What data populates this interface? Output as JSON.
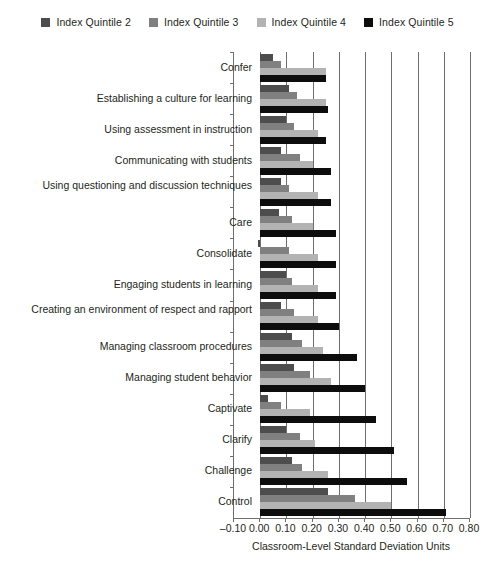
{
  "chart_data": {
    "type": "bar",
    "orientation": "horizontal",
    "title": "",
    "xlabel": "Classroom-Level Standard Deviation Units",
    "ylabel": "",
    "xlim": [
      -0.1,
      0.8
    ],
    "xticks": [
      "-0.10",
      "0.00",
      "0.10",
      "0.20",
      "0.30",
      "0.40",
      "0.50",
      "0.60",
      "0.70",
      "0.80"
    ],
    "xtick_values": [
      -0.1,
      0.0,
      0.1,
      0.2,
      0.3,
      0.4,
      0.5,
      0.6,
      0.7,
      0.8
    ],
    "grid": true,
    "legend_position": "top",
    "categories": [
      "Confer",
      "Establishing a culture for learning",
      "Using assessment in instruction",
      "Communicating with students",
      "Using questioning and discussion techniques",
      "Care",
      "Consolidate",
      "Engaging students in learning",
      "Creating an environment of respect and rapport",
      "Managing classroom procedures",
      "Managing student behavior",
      "Captivate",
      "Clarify",
      "Challenge",
      "Control"
    ],
    "series": [
      {
        "name": "Index Quintile 2",
        "color": "#4d4d4d",
        "values": [
          0.05,
          0.11,
          0.1,
          0.08,
          0.08,
          0.07,
          -0.01,
          0.1,
          0.08,
          0.12,
          0.13,
          0.03,
          0.1,
          0.12,
          0.26
        ]
      },
      {
        "name": "Index Quintile 3",
        "color": "#808080",
        "values": [
          0.08,
          0.14,
          0.13,
          0.15,
          0.11,
          0.12,
          0.11,
          0.12,
          0.13,
          0.16,
          0.19,
          0.08,
          0.15,
          0.16,
          0.36
        ]
      },
      {
        "name": "Index Quintile 4",
        "color": "#b3b3b3",
        "values": [
          0.25,
          0.25,
          0.22,
          0.2,
          0.22,
          0.2,
          0.22,
          0.22,
          0.22,
          0.24,
          0.27,
          0.19,
          0.21,
          0.26,
          0.5
        ]
      },
      {
        "name": "Index Quintile 5",
        "color": "#0d0d0d",
        "values": [
          0.25,
          0.26,
          0.25,
          0.27,
          0.27,
          0.29,
          0.29,
          0.29,
          0.3,
          0.37,
          0.4,
          0.44,
          0.51,
          0.56,
          0.71
        ]
      }
    ]
  },
  "legend": {
    "items": [
      {
        "label": "Index Quintile 2",
        "color": "#4d4d4d"
      },
      {
        "label": "Index Quintile 3",
        "color": "#808080"
      },
      {
        "label": "Index Quintile 4",
        "color": "#b3b3b3"
      },
      {
        "label": "Index Quintile 5",
        "color": "#0d0d0d"
      }
    ]
  }
}
